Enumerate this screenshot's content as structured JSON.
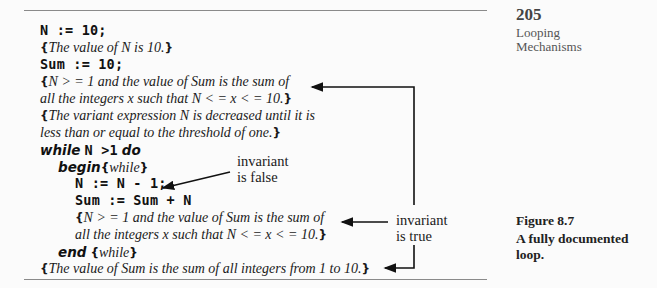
{
  "page": {
    "number": "205",
    "section_lines": [
      "Looping",
      "Mechanisms"
    ]
  },
  "figure": {
    "label": "Figure 8.7",
    "caption_lines": [
      "A fully documented",
      "loop."
    ]
  },
  "code": {
    "line1": "N := 10;",
    "line2_open": "{",
    "line2_text": "The value of N is 10.",
    "line2_close": "}",
    "line3": "Sum := 10;",
    "line4_open": "{",
    "line4_text": "N > = 1 and the value of Sum is the sum of",
    "line5_text": "all the integers x such that N < = x < = 10.",
    "line5_close": "}",
    "line6_open": "{",
    "line6_text": "The variant expression N is decreased until it is",
    "line7_text": "less than or equal to the threshold of one.",
    "line7_close": "}",
    "line8_kw1": "while",
    "line8_code": "N >1",
    "line8_kw2": "do",
    "line9_kw": "begin",
    "line9_open": "{",
    "line9_text": "while",
    "line9_close": "}",
    "line10": "N := N - 1;",
    "line11": "Sum := Sum + N",
    "line12_open": "{",
    "line12_text": "N > = 1 and the value of Sum is the sum of",
    "line13_text": "all the integers x such that N < = x < = 10.",
    "line13_close": "}",
    "line14_kw": "end",
    "line14_open": "{",
    "line14_text": "while",
    "line14_close": "}",
    "line15_open": "{",
    "line15_text": "The value of Sum is the sum of all integers from 1 to 10.",
    "line15_close": "}"
  },
  "annotations": {
    "false_line1": "invariant",
    "false_line2": "is false",
    "true_line1": "invariant",
    "true_line2": "is true"
  }
}
